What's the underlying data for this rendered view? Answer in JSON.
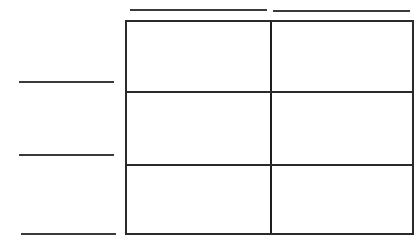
{
  "diagram": {
    "type": "blank-grid-worksheet",
    "columns": 2,
    "rows": 3,
    "column_label_blanks": [
      "",
      ""
    ],
    "row_label_blanks": [
      "",
      "",
      ""
    ],
    "cells": [
      [
        "",
        ""
      ],
      [
        "",
        ""
      ],
      [
        "",
        ""
      ]
    ],
    "line_color": "#2a2a2a",
    "background": "#ffffff"
  }
}
